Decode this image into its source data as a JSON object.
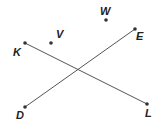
{
  "diagram": {
    "type": "geometry",
    "colors": {
      "line": "#555555",
      "point": "#333333",
      "label": "#222222"
    },
    "points": {
      "K": {
        "label": "K",
        "x": 25,
        "y": 43,
        "lx": 13,
        "ly": 56
      },
      "V": {
        "label": "V",
        "x": 51,
        "y": 43,
        "lx": 56,
        "ly": 38
      },
      "W": {
        "label": "W",
        "x": 106,
        "y": 20,
        "lx": 100,
        "ly": 15
      },
      "E": {
        "label": "E",
        "x": 135,
        "y": 29,
        "lx": 136,
        "ly": 40
      },
      "D": {
        "label": "D",
        "x": 25,
        "y": 107,
        "lx": 16,
        "ly": 119
      },
      "L": {
        "label": "L",
        "x": 147,
        "y": 104,
        "lx": 145,
        "ly": 117
      }
    },
    "segments": [
      {
        "name": "KL",
        "from": "K",
        "to": "L"
      },
      {
        "name": "DE",
        "from": "D",
        "to": "E"
      }
    ],
    "intersection": {
      "x": 77,
      "y": 70
    }
  }
}
